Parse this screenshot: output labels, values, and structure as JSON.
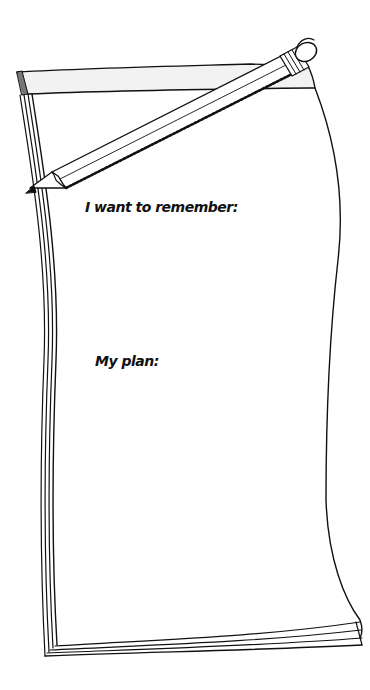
{
  "notepad": {
    "prompts": [
      {
        "label": "I want to remember:"
      },
      {
        "label": "My plan:"
      }
    ]
  },
  "illustration": {
    "objects": [
      "notepad-icon",
      "pencil-icon"
    ],
    "stroke_color": "#111111",
    "paper_color": "#ffffff",
    "band_shade": "#f2f2f2"
  }
}
